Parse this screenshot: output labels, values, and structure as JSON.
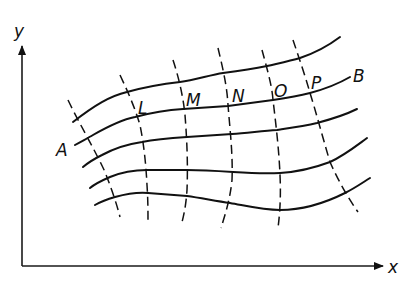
{
  "figure": {
    "axes": {
      "x_label": "x",
      "y_label": "y"
    },
    "curve_labels": {
      "start": "A",
      "end": "B"
    },
    "point_labels": [
      "L",
      "M",
      "N",
      "O",
      "P"
    ],
    "colors": {
      "ink": "#111111",
      "background": "#ffffff"
    },
    "solid_curve_count": 5,
    "dashed_curve_count": 6
  }
}
